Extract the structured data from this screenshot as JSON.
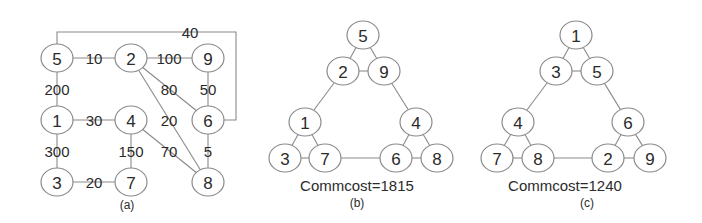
{
  "diagram": {
    "panels": [
      {
        "id": "a",
        "caption": "(a)",
        "caption_pos": [
          127,
          205
        ],
        "nodes": [
          {
            "id": "5",
            "label": "5",
            "x": 57,
            "y": 58
          },
          {
            "id": "2",
            "label": "2",
            "x": 131,
            "y": 58
          },
          {
            "id": "9",
            "label": "9",
            "x": 208,
            "y": 58
          },
          {
            "id": "1",
            "label": "1",
            "x": 57,
            "y": 120
          },
          {
            "id": "4",
            "label": "4",
            "x": 131,
            "y": 120
          },
          {
            "id": "6",
            "label": "6",
            "x": 208,
            "y": 120
          },
          {
            "id": "3",
            "label": "3",
            "x": 57,
            "y": 182
          },
          {
            "id": "7",
            "label": "7",
            "x": 131,
            "y": 182
          },
          {
            "id": "8",
            "label": "8",
            "x": 208,
            "y": 182
          }
        ],
        "edges": [
          {
            "from": "5",
            "to": "2",
            "weight": "10",
            "label_pos": [
              94,
              58
            ]
          },
          {
            "from": "2",
            "to": "9",
            "weight": "100",
            "label_pos": [
              169,
              58
            ]
          },
          {
            "from": "5",
            "to": "1",
            "weight": "200",
            "label_pos": [
              57,
              89
            ]
          },
          {
            "from": "9",
            "to": "6",
            "weight": "50",
            "label_pos": [
              208,
              89
            ]
          },
          {
            "from": "1",
            "to": "4",
            "weight": "30",
            "label_pos": [
              94,
              120
            ]
          },
          {
            "from": "1",
            "to": "3",
            "weight": "300",
            "label_pos": [
              57,
              151
            ]
          },
          {
            "from": "4",
            "to": "7",
            "weight": "150",
            "label_pos": [
              131,
              151
            ]
          },
          {
            "from": "6",
            "to": "8",
            "weight": "5",
            "label_pos": [
              208,
              151
            ]
          },
          {
            "from": "3",
            "to": "7",
            "weight": "20",
            "label_pos": [
              94,
              182
            ]
          },
          {
            "from": "2",
            "to": "6",
            "weight": "80",
            "label_pos": [
              169,
              89
            ]
          },
          {
            "from": "2",
            "to": "8",
            "weight": "20",
            "label_pos": [
              169,
              120
            ]
          },
          {
            "from": "4",
            "to": "8",
            "weight": "70",
            "label_pos": [
              169,
              151
            ]
          },
          {
            "from": "5",
            "to": "6",
            "weight": "40",
            "label_pos": [
              190,
              32
            ],
            "routed": true
          }
        ]
      },
      {
        "id": "b",
        "caption": "(b)",
        "caption_pos": [
          357,
          203
        ],
        "cost_label": "Commcost=1815",
        "cost_pos": [
          357,
          185
        ],
        "nodes": [
          {
            "id": "5",
            "label": "5",
            "x": 363,
            "y": 35
          },
          {
            "id": "2",
            "label": "2",
            "x": 343,
            "y": 71
          },
          {
            "id": "9",
            "label": "9",
            "x": 384,
            "y": 71
          },
          {
            "id": "1",
            "label": "1",
            "x": 305,
            "y": 122
          },
          {
            "id": "4",
            "label": "4",
            "x": 416,
            "y": 122
          },
          {
            "id": "3",
            "label": "3",
            "x": 285,
            "y": 158
          },
          {
            "id": "7",
            "label": "7",
            "x": 325,
            "y": 158
          },
          {
            "id": "6",
            "label": "6",
            "x": 396,
            "y": 158
          },
          {
            "id": "8",
            "label": "8",
            "x": 437,
            "y": 158
          }
        ],
        "edges": [
          {
            "from": "5",
            "to": "2"
          },
          {
            "from": "5",
            "to": "9"
          },
          {
            "from": "2",
            "to": "9"
          },
          {
            "from": "2",
            "to": "1"
          },
          {
            "from": "9",
            "to": "4"
          },
          {
            "from": "1",
            "to": "3"
          },
          {
            "from": "1",
            "to": "7"
          },
          {
            "from": "3",
            "to": "7"
          },
          {
            "from": "4",
            "to": "6"
          },
          {
            "from": "4",
            "to": "8"
          },
          {
            "from": "6",
            "to": "8"
          },
          {
            "from": "7",
            "to": "6"
          }
        ]
      },
      {
        "id": "c",
        "caption": "(c)",
        "caption_pos": [
          587,
          203
        ],
        "cost_label": "Commcost=1240",
        "cost_pos": [
          565,
          185
        ],
        "nodes": [
          {
            "id": "1",
            "label": "1",
            "x": 576,
            "y": 35
          },
          {
            "id": "3",
            "label": "3",
            "x": 556,
            "y": 71
          },
          {
            "id": "5",
            "label": "5",
            "x": 597,
            "y": 71
          },
          {
            "id": "4",
            "label": "4",
            "x": 518,
            "y": 122
          },
          {
            "id": "6",
            "label": "6",
            "x": 628,
            "y": 122
          },
          {
            "id": "7",
            "label": "7",
            "x": 497,
            "y": 158
          },
          {
            "id": "8",
            "label": "8",
            "x": 538,
            "y": 158
          },
          {
            "id": "2",
            "label": "2",
            "x": 608,
            "y": 158
          },
          {
            "id": "9",
            "label": "9",
            "x": 650,
            "y": 158
          }
        ],
        "edges": [
          {
            "from": "1",
            "to": "3"
          },
          {
            "from": "1",
            "to": "5"
          },
          {
            "from": "3",
            "to": "5"
          },
          {
            "from": "3",
            "to": "4"
          },
          {
            "from": "5",
            "to": "6"
          },
          {
            "from": "4",
            "to": "7"
          },
          {
            "from": "4",
            "to": "8"
          },
          {
            "from": "7",
            "to": "8"
          },
          {
            "from": "6",
            "to": "2"
          },
          {
            "from": "6",
            "to": "9"
          },
          {
            "from": "2",
            "to": "9"
          },
          {
            "from": "8",
            "to": "2"
          }
        ]
      }
    ],
    "style": {
      "node_rx": 16,
      "node_ry": 14,
      "stroke_color": "#8a8a8a",
      "text_color": "#2b2b2b",
      "background": "#ffffff"
    }
  }
}
